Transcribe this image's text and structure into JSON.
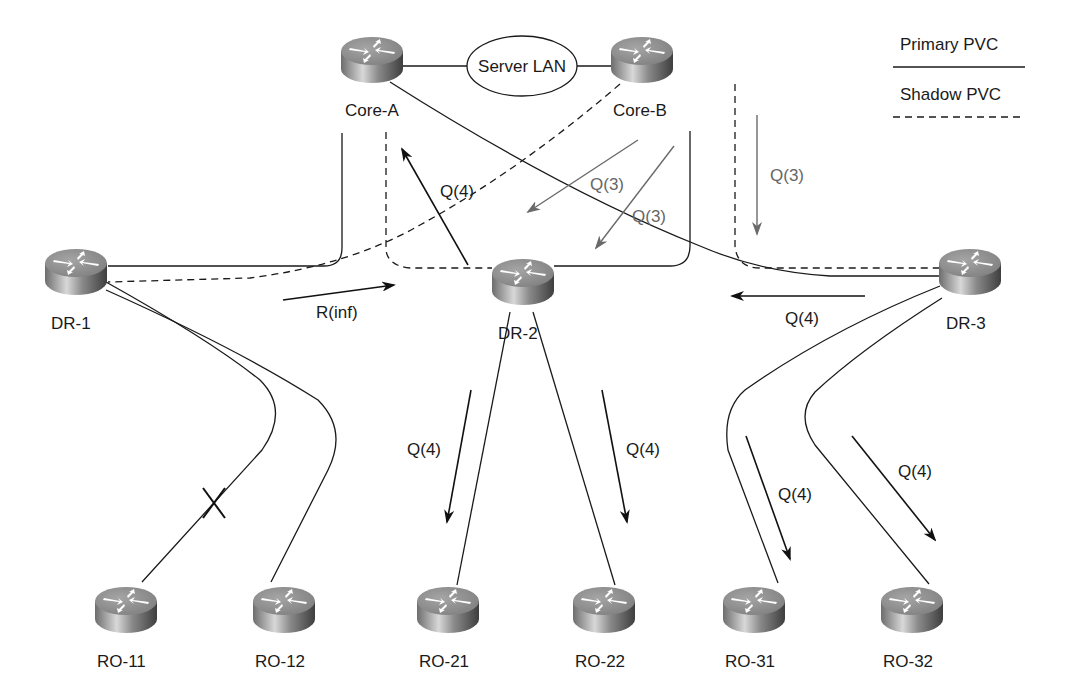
{
  "diagram": {
    "legend": {
      "primary_label": "Primary PVC",
      "shadow_label": "Shadow PVC"
    },
    "server_lan": {
      "label": "Server LAN"
    },
    "routers": [
      {
        "id": "core-a",
        "label": "Core-A",
        "x": 372,
        "y": 60,
        "lx": 345,
        "ly": 116
      },
      {
        "id": "core-b",
        "label": "Core-B",
        "x": 642,
        "y": 60,
        "lx": 613,
        "ly": 116
      },
      {
        "id": "dr-1",
        "label": "DR-1",
        "x": 76,
        "y": 272,
        "lx": 51,
        "ly": 329
      },
      {
        "id": "dr-2",
        "label": "DR-2",
        "x": 523,
        "y": 282,
        "lx": 498,
        "ly": 339
      },
      {
        "id": "dr-3",
        "label": "DR-3",
        "x": 970,
        "y": 272,
        "lx": 946,
        "ly": 329
      },
      {
        "id": "ro-11",
        "label": "RO-11",
        "x": 126,
        "y": 610,
        "lx": 97,
        "ly": 667
      },
      {
        "id": "ro-12",
        "label": "RO-12",
        "x": 284,
        "y": 610,
        "lx": 255,
        "ly": 667
      },
      {
        "id": "ro-21",
        "label": "RO-21",
        "x": 448,
        "y": 610,
        "lx": 419,
        "ly": 667
      },
      {
        "id": "ro-22",
        "label": "RO-22",
        "x": 604,
        "y": 610,
        "lx": 575,
        "ly": 667
      },
      {
        "id": "ro-31",
        "label": "RO-31",
        "x": 754,
        "y": 610,
        "lx": 725,
        "ly": 667
      },
      {
        "id": "ro-32",
        "label": "RO-32",
        "x": 912,
        "y": 610,
        "lx": 883,
        "ly": 667
      }
    ],
    "messages": [
      {
        "id": "q4-dr2-to-corea",
        "label": "Q(4)",
        "color": "black"
      },
      {
        "id": "q3-coreb-shadow-dr1",
        "label": "Q(3)",
        "color": "gray"
      },
      {
        "id": "q3-coreb-to-dr2",
        "label": "Q(3)",
        "color": "gray"
      },
      {
        "id": "q3-coreb-down-dr3",
        "label": "Q(3)",
        "color": "gray"
      },
      {
        "id": "rinf-dr1-to-dr2",
        "label": "R(inf)",
        "color": "black"
      },
      {
        "id": "q4-dr3-to-dr2",
        "label": "Q(4)",
        "color": "black"
      },
      {
        "id": "q4-dr2-to-ro21",
        "label": "Q(4)",
        "color": "black"
      },
      {
        "id": "q4-dr2-to-ro22",
        "label": "Q(4)",
        "color": "black"
      },
      {
        "id": "q4-dr3-to-ro31",
        "label": "Q(4)",
        "color": "black"
      },
      {
        "id": "q4-dr3-to-ro32",
        "label": "Q(4)",
        "color": "black"
      }
    ],
    "failed_link": {
      "between": [
        "DR-1",
        "RO-11"
      ],
      "marker": "X"
    },
    "colors": {
      "line": "#1a1a1a",
      "gray_arrow": "#6a6a6a",
      "router_top": "#8c8c8c",
      "router_side": "#5a5a5a"
    }
  }
}
